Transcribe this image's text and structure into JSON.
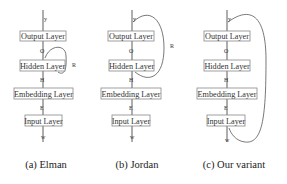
{
  "panels": [
    {
      "id": "a",
      "caption": "(a) Elman",
      "layers": [
        "Output Layer",
        "Hidden Layer",
        "Embedding Layer",
        "Input Layer"
      ],
      "edge_labels": {
        "top": "y",
        "out": "O",
        "hid": "H",
        "emb": "E",
        "in": "w"
      },
      "recurrence_label": "R",
      "recurrence": "hidden-to-hidden"
    },
    {
      "id": "b",
      "caption": "(b) Jordan",
      "layers": [
        "Output Layer",
        "Hidden Layer",
        "Embedding Layer",
        "Input Layer"
      ],
      "edge_labels": {
        "top": "y",
        "out": "O",
        "hid": "H",
        "emb": "E",
        "in": "w"
      },
      "recurrence_label": "R",
      "recurrence": "output-to-hidden"
    },
    {
      "id": "c",
      "caption": "(c) Our variant",
      "layers": [
        "Output Layer",
        "Hidden Layer",
        "Embedding Layer",
        "Input Layer"
      ],
      "edge_labels": {
        "top": "y",
        "out": "O",
        "hid": "H",
        "emb": "E",
        "in": "w"
      },
      "recurrence_label": "",
      "recurrence": "output-to-input"
    }
  ]
}
